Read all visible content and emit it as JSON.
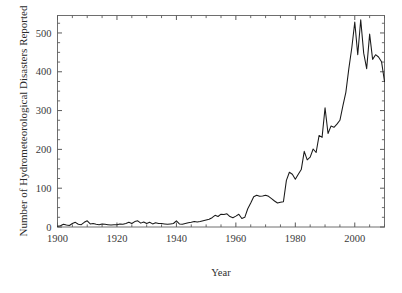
{
  "chart_data": {
    "type": "line",
    "title": "",
    "xlabel": "Year",
    "ylabel": "Number of Hydrometeorological Disasters Reported",
    "xlim": [
      1900,
      2010
    ],
    "ylim": [
      0,
      545
    ],
    "grid": false,
    "legend": "none",
    "xticks": [
      1900,
      1920,
      1940,
      1960,
      1980,
      2000
    ],
    "xtick_labels": [
      "1900",
      "1920",
      "1940",
      "1960",
      "1980",
      "2000"
    ],
    "xminor_step": 5,
    "yticks": [
      0,
      100,
      200,
      300,
      400,
      500
    ],
    "ytick_labels": [
      "0",
      "100",
      "200",
      "300",
      "400",
      "500"
    ],
    "yminor_step": 25,
    "line_color": "#1a1a1a",
    "axis_color": "#6e6e6e",
    "background_color": "#ffffff",
    "series": [
      {
        "name": "Hydrometeorological disasters reported",
        "x": [
          1900,
          1901,
          1902,
          1903,
          1904,
          1905,
          1906,
          1907,
          1908,
          1909,
          1910,
          1911,
          1912,
          1913,
          1914,
          1915,
          1916,
          1917,
          1918,
          1919,
          1920,
          1921,
          1922,
          1923,
          1924,
          1925,
          1926,
          1927,
          1928,
          1929,
          1930,
          1931,
          1932,
          1933,
          1934,
          1935,
          1936,
          1937,
          1938,
          1939,
          1940,
          1941,
          1942,
          1943,
          1944,
          1945,
          1946,
          1947,
          1948,
          1949,
          1950,
          1951,
          1952,
          1953,
          1954,
          1955,
          1956,
          1957,
          1958,
          1959,
          1960,
          1961,
          1962,
          1963,
          1964,
          1965,
          1966,
          1967,
          1968,
          1969,
          1970,
          1971,
          1972,
          1973,
          1974,
          1975,
          1976,
          1977,
          1978,
          1979,
          1980,
          1981,
          1982,
          1983,
          1984,
          1985,
          1986,
          1987,
          1988,
          1989,
          1990,
          1991,
          1992,
          1993,
          1994,
          1995,
          1996,
          1997,
          1998,
          1999,
          2000,
          2001,
          2002,
          2003,
          2004,
          2005,
          2006,
          2007,
          2008,
          2009,
          2010
        ],
        "values": [
          2,
          3,
          7,
          5,
          4,
          9,
          12,
          7,
          6,
          12,
          16,
          8,
          9,
          7,
          6,
          8,
          7,
          6,
          5,
          6,
          6,
          8,
          7,
          9,
          12,
          9,
          14,
          16,
          10,
          13,
          9,
          12,
          8,
          11,
          9,
          9,
          8,
          7,
          8,
          9,
          16,
          8,
          7,
          9,
          11,
          12,
          14,
          13,
          14,
          16,
          18,
          20,
          24,
          30,
          27,
          33,
          32,
          34,
          27,
          24,
          28,
          33,
          22,
          25,
          47,
          62,
          78,
          82,
          79,
          80,
          82,
          79,
          73,
          67,
          62,
          64,
          65,
          120,
          141,
          136,
          123,
          136,
          148,
          195,
          173,
          180,
          201,
          192,
          236,
          231,
          307,
          241,
          260,
          257,
          265,
          275,
          312,
          347,
          408,
          462,
          528,
          444,
          534,
          448,
          408,
          497,
          432,
          444,
          438,
          426,
          375
        ]
      }
    ]
  },
  "figure": {
    "xaxis_title": "Year",
    "yaxis_title": "Number of Hydrometeorological Disasters Reported"
  }
}
